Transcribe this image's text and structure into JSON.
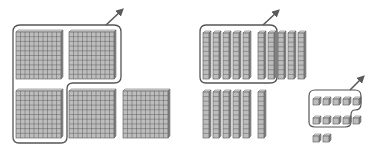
{
  "diagram": {
    "title": "Base-ten blocks regrouping",
    "colors": {
      "block_fill": "#bdbdbd",
      "block_top": "#e2e2e2",
      "block_side": "#8f8f8f",
      "grid_line": "#555555",
      "outline": "#555555",
      "arrow": "#5a5a5a"
    },
    "hundreds": {
      "label": "hundreds flats",
      "count": 5,
      "grouped": 3,
      "flats": [
        {
          "x": 16,
          "y": 30,
          "grouped": true
        },
        {
          "x": 69,
          "y": 30,
          "grouped": true
        },
        {
          "x": 16,
          "y": 89,
          "grouped": true
        },
        {
          "x": 69,
          "y": 89,
          "grouped": false
        },
        {
          "x": 123,
          "y": 89,
          "grouped": false
        }
      ]
    },
    "tens": {
      "label": "tens rods",
      "count": 16,
      "grouped": 7,
      "rods": [
        {
          "x": 203,
          "y": 31
        },
        {
          "x": 213,
          "y": 31
        },
        {
          "x": 223,
          "y": 31
        },
        {
          "x": 233,
          "y": 31
        },
        {
          "x": 243,
          "y": 31
        },
        {
          "x": 258,
          "y": 31
        },
        {
          "x": 268,
          "y": 31
        },
        {
          "x": 278,
          "y": 31
        },
        {
          "x": 288,
          "y": 31
        },
        {
          "x": 298,
          "y": 31
        },
        {
          "x": 203,
          "y": 90
        },
        {
          "x": 213,
          "y": 90
        },
        {
          "x": 223,
          "y": 90
        },
        {
          "x": 233,
          "y": 90
        },
        {
          "x": 243,
          "y": 90
        },
        {
          "x": 258,
          "y": 90
        }
      ]
    },
    "ones": {
      "label": "ones cubes",
      "count": 12,
      "grouped": 9,
      "cubes": [
        {
          "x": 313,
          "y": 97
        },
        {
          "x": 323,
          "y": 97
        },
        {
          "x": 333,
          "y": 97
        },
        {
          "x": 343,
          "y": 97
        },
        {
          "x": 353,
          "y": 97
        },
        {
          "x": 313,
          "y": 116
        },
        {
          "x": 323,
          "y": 116
        },
        {
          "x": 333,
          "y": 116
        },
        {
          "x": 343,
          "y": 116
        },
        {
          "x": 353,
          "y": 116
        },
        {
          "x": 313,
          "y": 134
        },
        {
          "x": 323,
          "y": 134
        }
      ]
    }
  }
}
